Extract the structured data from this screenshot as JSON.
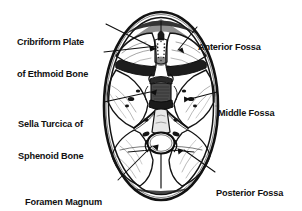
{
  "figure": {
    "type": "anatomical-illustration",
    "background_color": "#ffffff",
    "ink_color": "#111111",
    "width": 302,
    "height": 211
  },
  "labels": {
    "cribriform": {
      "name": "cribriform-plate-of-ethmoid-bone",
      "line1": "Cribriform Plate",
      "line2": "of Ethmoid Bone",
      "side": "left",
      "target": "crista galli / cribriform plate at anterior midline"
    },
    "sella": {
      "name": "sella-turcica-of-sphenoid-bone",
      "line1": "Sella Turcica of",
      "line2": "Sphenoid Bone",
      "side": "left",
      "target": "sella turcica at central skull base"
    },
    "foramen": {
      "name": "foramen-magnum",
      "line1": "Foramen Magnum",
      "side": "left",
      "target": "large posterior midline opening"
    },
    "anterior": {
      "name": "anterior-fossa",
      "line1": "Anterior Fossa",
      "side": "right",
      "target": "anterior cranial fossa, right side"
    },
    "middle": {
      "name": "middle-fossa",
      "line1": "Middle Fossa",
      "side": "right",
      "target": "middle cranial fossa, right side"
    },
    "posterior": {
      "name": "posterior-fossa",
      "line1": "Posterior Fossa",
      "side": "right",
      "target": "posterior cranial fossa, right side"
    }
  }
}
